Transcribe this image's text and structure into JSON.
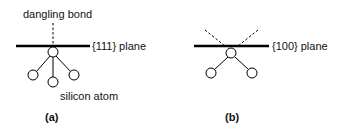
{
  "panels": [
    {
      "id": "a",
      "caption": "(a)",
      "plane_label": "{111} plane",
      "dangling_label": "dangling bond",
      "atom_label": "silicon atom",
      "dangling_bonds": 1,
      "back_bonds": 3
    },
    {
      "id": "b",
      "caption": "(b)",
      "plane_label": "{100} plane",
      "dangling_bonds": 2,
      "back_bonds": 2
    }
  ],
  "colors": {
    "line": "#000000",
    "background": "#ffffff"
  }
}
